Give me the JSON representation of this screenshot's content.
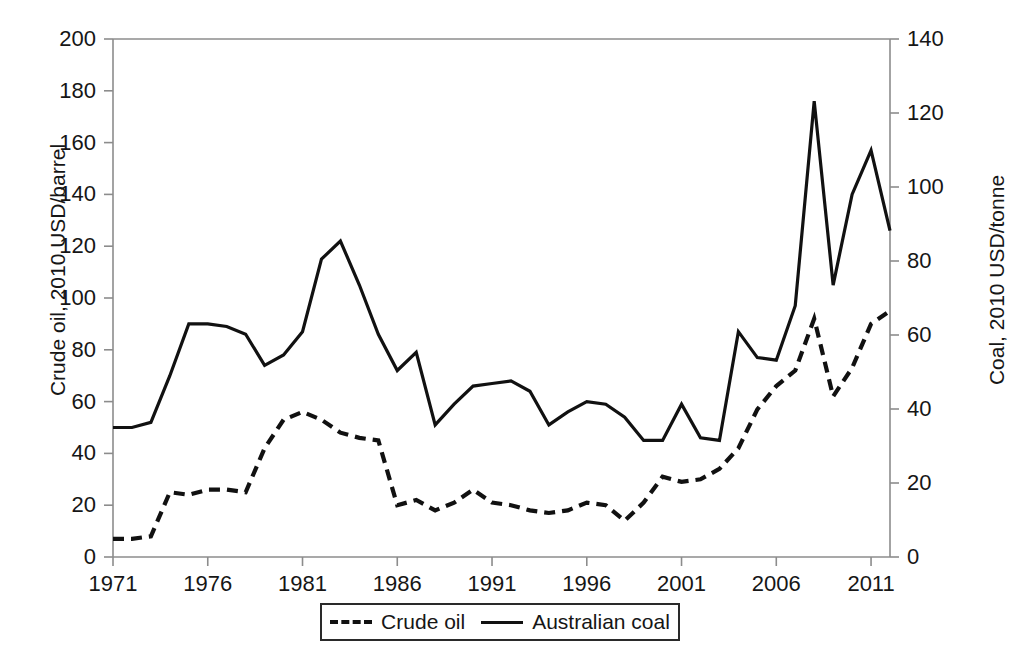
{
  "chart_data": {
    "type": "line",
    "title": "",
    "xlabel": "",
    "ylabel": "Crude oil, 2010 USD/barrel",
    "ylabel_right": "Coal, 2010 USD/tonne",
    "xlim": [
      1971,
      2012
    ],
    "ylim": [
      0,
      200
    ],
    "ylim_right": [
      0,
      140
    ],
    "grid": false,
    "legend_position": "bottom-center",
    "x_tick_labels": [
      "1971",
      "1976",
      "1981",
      "1986",
      "1991",
      "1996",
      "2001",
      "2006",
      "2011"
    ],
    "x_tick_values": [
      1971,
      1976,
      1981,
      1986,
      1991,
      1996,
      2001,
      2006,
      2011
    ],
    "y_tick_labels_left": [
      "0",
      "20",
      "40",
      "60",
      "80",
      "100",
      "120",
      "140",
      "160",
      "180",
      "200"
    ],
    "y_tick_values_left": [
      0,
      20,
      40,
      60,
      80,
      100,
      120,
      140,
      160,
      180,
      200
    ],
    "y_tick_labels_right": [
      "0",
      "20",
      "40",
      "60",
      "80",
      "100",
      "120",
      "140"
    ],
    "y_tick_values_right": [
      0,
      20,
      40,
      60,
      80,
      100,
      120,
      140
    ],
    "x": [
      1971,
      1972,
      1973,
      1974,
      1975,
      1976,
      1977,
      1978,
      1979,
      1980,
      1981,
      1982,
      1983,
      1984,
      1985,
      1986,
      1987,
      1988,
      1989,
      1990,
      1991,
      1992,
      1993,
      1994,
      1995,
      1996,
      1997,
      1998,
      1999,
      2000,
      2001,
      2002,
      2003,
      2004,
      2005,
      2006,
      2007,
      2008,
      2009,
      2010,
      2011,
      2012
    ],
    "series": [
      {
        "name": "Crude oil",
        "axis": "left",
        "units": "2010 USD/barrel",
        "style": "dashed",
        "color": "#111111",
        "values": [
          7,
          7,
          8,
          25,
          24,
          26,
          26,
          25,
          42,
          53,
          56,
          53,
          48,
          46,
          45,
          20,
          22,
          18,
          21,
          26,
          21,
          20,
          18,
          17,
          18,
          21,
          20,
          14,
          21,
          31,
          29,
          30,
          34,
          42,
          57,
          66,
          72,
          92,
          62,
          73,
          90,
          95
        ]
      },
      {
        "name": "Australian coal",
        "axis": "right",
        "units": "2010 USD/tonne",
        "style": "solid",
        "color": "#111111",
        "values_left_scale": [
          50,
          50,
          52,
          70,
          90,
          90,
          89,
          86,
          74,
          78,
          87,
          115,
          122,
          105,
          86,
          72,
          79,
          51,
          59,
          66,
          67,
          68,
          64,
          51,
          56,
          60,
          59,
          54,
          45,
          45,
          59,
          46,
          45,
          87,
          77,
          76,
          97,
          176,
          105,
          140,
          157,
          126
        ]
      }
    ]
  },
  "legend": {
    "items": [
      {
        "label": "Crude oil",
        "style": "dashed"
      },
      {
        "label": "Australian coal",
        "style": "solid"
      }
    ]
  },
  "colors": {
    "line": "#111111",
    "axis": "#8c8c8c",
    "text": "#161616",
    "background": "#ffffff"
  }
}
